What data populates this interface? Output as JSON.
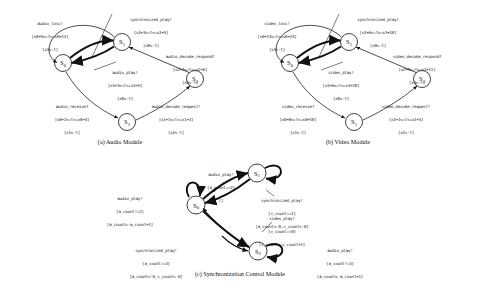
{
  "figure": {
    "modules": [
      {
        "id": "audio-module",
        "caption": "(a) Audio Module",
        "states": [
          {
            "name": "S0"
          },
          {
            "name": "S1"
          },
          {
            "name": "S2"
          },
          {
            "name": "S1"
          }
        ],
        "transitions": [
          {
            "id": "audio-loss",
            "event": "audio_loss!",
            "guard": "[x0+5<=t<=x0+13]",
            "action": "[x3<-t]"
          },
          {
            "id": "synchronized-play",
            "event": "synchronized_play!",
            "guard": "[x3+3<=t<=x3+5]",
            "action": "[x0<-t]"
          },
          {
            "id": "audio-decode-respond",
            "event": "audio_decode_respond?",
            "guard": "[x2+4<=t<=x2+6]",
            "action": "[x3<-t]"
          },
          {
            "id": "audio-play",
            "event": "audio_play!",
            "guard": "[x3+3<=t<=x3+5]",
            "action": "[x0<-t]"
          },
          {
            "id": "audio-receive",
            "event": "audio_receive?",
            "guard": "[x0+2<=t<=x0+4]",
            "action": "[x1<-t]"
          },
          {
            "id": "audio-decode-request",
            "event": "audio_decode_request!",
            "guard": "[x1+1<=t<=x1+3]",
            "action": "[x2<-t]"
          }
        ]
      },
      {
        "id": "video-module",
        "caption": "(b) Video Module",
        "states": [
          {
            "name": "S0"
          },
          {
            "name": "S1"
          },
          {
            "name": "S2"
          },
          {
            "name": "S1"
          }
        ],
        "transitions": [
          {
            "id": "video-loss",
            "event": "video_loss!",
            "guard": "[x0+14<=t<=x0+24]",
            "action": "[x3<-t]"
          },
          {
            "id": "synchronized-play",
            "event": "synchronized_play!",
            "guard": "[x3+6<=t<=x3+10]",
            "action": "[x0<-t]"
          },
          {
            "id": "video-decode-respond",
            "event": "video_decode_respond?",
            "guard": "[x2+9<=t<=x2+11]",
            "action": "[x3<-t]"
          },
          {
            "id": "video-play",
            "event": "video_play!",
            "guard": "[x3+6<=t<=x3+10]",
            "action": "[x0<-t]"
          },
          {
            "id": "video-receive",
            "event": "video_receive?",
            "guard": "[x0+8<=t<=x0+10]",
            "action": "[x1<-t]"
          },
          {
            "id": "video-decode-request",
            "event": "video_decode_request!",
            "guard": "[x1+1<=t<=x1+3]",
            "action": "[x2<-t]"
          }
        ]
      },
      {
        "id": "sync-module",
        "caption": "(c) Synchronization Control Module",
        "states": [
          {
            "name": "S0"
          },
          {
            "name": "S1"
          },
          {
            "name": "S2"
          }
        ],
        "transitions": [
          {
            "id": "audio-play-top",
            "event": "audio_play!",
            "guard": "[a_count==2]",
            "action": "[]"
          },
          {
            "id": "audio-play-left",
            "event": "audio_play!",
            "guard": "[a_count!=2]",
            "action": "[a_count<-a_count+1]"
          },
          {
            "id": "synchronized-play-right",
            "event": "synchronized_play!",
            "guard": "[v_count==1]",
            "action": "[a_count<-0,v_count<-0]"
          },
          {
            "id": "video-play-right",
            "event": "video_play!",
            "guard": "[v_count==0]",
            "action": "[v_count<-v_count+1]"
          },
          {
            "id": "synchronized-play-bottom",
            "event": "synchronized_play!",
            "guard": "[a_count==3]",
            "action": "[a_count<-0,v_count<-0]"
          },
          {
            "id": "audio-play-bottom",
            "event": "audio_play!",
            "guard": "[a_count!=3]",
            "action": "[a_count<-a_count+1]"
          }
        ]
      }
    ]
  }
}
